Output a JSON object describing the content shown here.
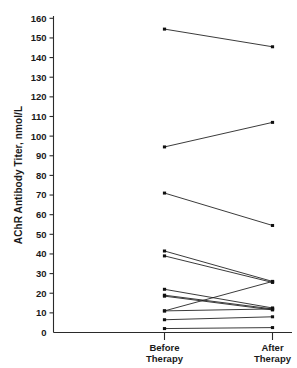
{
  "chart_data": {
    "type": "line",
    "title": "",
    "xlabel": "",
    "ylabel": "AChR Antibody Titer, nmol/L",
    "categories": [
      "Before Therapy",
      "After Therapy"
    ],
    "category_labels": [
      {
        "line1": "Before",
        "line2": "Therapy"
      },
      {
        "line1": "After",
        "line2": "Therapy"
      }
    ],
    "ylim": [
      0,
      163
    ],
    "yticks": [
      0,
      10,
      20,
      30,
      40,
      50,
      60,
      70,
      80,
      90,
      100,
      110,
      120,
      130,
      140,
      150,
      160
    ],
    "ytick_labels": [
      "0",
      "10",
      "20",
      "30",
      "40",
      "50",
      "60",
      "70",
      "80",
      "90",
      "100",
      "110",
      "120",
      "130",
      "140",
      "150",
      "160"
    ],
    "grid": false,
    "legend": false,
    "series": [
      {
        "name": "patient-1",
        "values": [
          154.5,
          145.5
        ]
      },
      {
        "name": "patient-2",
        "values": [
          94.5,
          107.0
        ]
      },
      {
        "name": "patient-3",
        "values": [
          71.0,
          54.5
        ]
      },
      {
        "name": "patient-4",
        "values": [
          41.5,
          26.0
        ]
      },
      {
        "name": "patient-5",
        "values": [
          39.0,
          25.5
        ]
      },
      {
        "name": "patient-6",
        "values": [
          22.0,
          12.5
        ]
      },
      {
        "name": "patient-7",
        "values": [
          19.0,
          12.0
        ]
      },
      {
        "name": "patient-8",
        "values": [
          18.5,
          11.5
        ]
      },
      {
        "name": "patient-9",
        "values": [
          11.0,
          26.0
        ]
      },
      {
        "name": "patient-10",
        "values": [
          11.0,
          12.0
        ]
      },
      {
        "name": "patient-11",
        "values": [
          6.5,
          8.0
        ]
      },
      {
        "name": "patient-12",
        "values": [
          2.0,
          2.5
        ]
      }
    ],
    "line_color": "#181818",
    "marker_color": "#101010",
    "axis_color": "#2a2a2a",
    "background_color": "#ffffff"
  }
}
